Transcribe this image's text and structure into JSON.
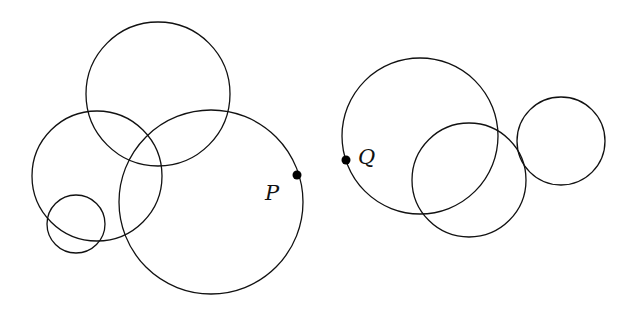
{
  "diagram": {
    "stroke_color": "#111111",
    "background": "#ffffff",
    "left_group": {
      "circles": [
        {
          "name": "top-circle",
          "cx": 158,
          "cy": 94,
          "r": 72
        },
        {
          "name": "left-circle",
          "cx": 97,
          "cy": 176,
          "r": 65
        },
        {
          "name": "small-circle",
          "cx": 76,
          "cy": 224,
          "r": 29
        },
        {
          "name": "big-circle",
          "cx": 211,
          "cy": 202,
          "r": 92
        }
      ],
      "point": {
        "label": "P",
        "x": 297,
        "y": 175,
        "label_x": 265,
        "label_y": 200
      }
    },
    "right_group": {
      "circles": [
        {
          "name": "q-circle",
          "cx": 420,
          "cy": 136,
          "r": 78
        },
        {
          "name": "middle-circle",
          "cx": 469,
          "cy": 180,
          "r": 57
        },
        {
          "name": "right-circle",
          "cx": 561,
          "cy": 141,
          "r": 44
        }
      ],
      "point": {
        "label": "Q",
        "x": 346,
        "y": 160,
        "label_x": 358,
        "label_y": 164
      }
    }
  }
}
